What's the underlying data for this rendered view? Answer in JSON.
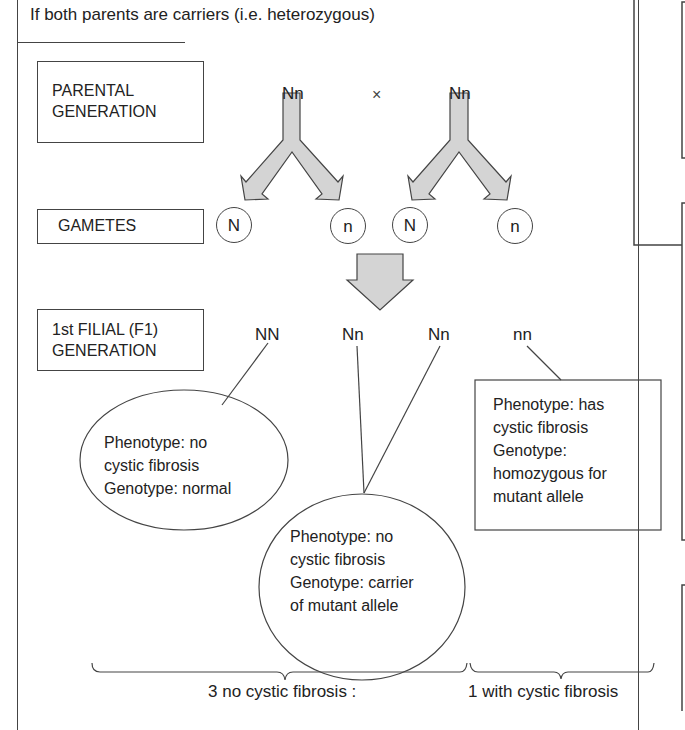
{
  "title": "If both parents are carriers (i.e. heterozygous)",
  "rows": {
    "parental": {
      "label_line1": "PARENTAL",
      "label_line2": "GENERATION",
      "parent1": "Nn",
      "cross_symbol": "×",
      "parent2": "Nn"
    },
    "gametes": {
      "label": "GAMETES",
      "alleles": [
        "N",
        "n",
        "N",
        "n"
      ]
    },
    "f1": {
      "label_line1": "1st FILIAL (F1)",
      "label_line2": "GENERATION",
      "genotypes": [
        "NN",
        "Nn",
        "Nn",
        "nn"
      ]
    }
  },
  "outcomes": {
    "normal": {
      "line1": "Phenotype: no",
      "line2": "cystic fibrosis",
      "line3": "Genotype: normal"
    },
    "carrier": {
      "line1": "Phenotype: no",
      "line2": "cystic fibrosis",
      "line3": "Genotype: carrier",
      "line4": "of mutant allele"
    },
    "affected": {
      "line1": "Phenotype: has",
      "line2": "cystic fibrosis",
      "line3": "Genotype:",
      "line4": "homozygous for",
      "line5": "mutant allele"
    }
  },
  "ratio": {
    "unaffected": "3 no cystic fibrosis :",
    "affected": "1 with cystic fibrosis"
  },
  "colors": {
    "arrow_fill": "#d4d4d4",
    "stroke": "#444444"
  }
}
